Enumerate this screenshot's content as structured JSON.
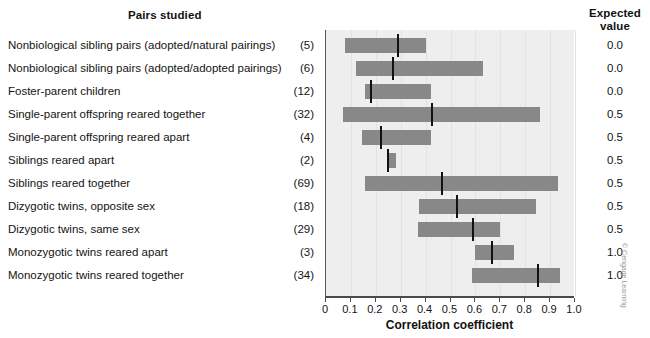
{
  "headers": {
    "pairs_studied": "Pairs studied",
    "expected_value": "Expected\nvalue",
    "expected_value_line1": "Expected",
    "expected_value_line2": "value"
  },
  "credit": "© Cengage Learning",
  "chart_data": {
    "type": "bar",
    "orientation": "horizontal-range",
    "title": "Pairs studied",
    "xlabel": "Correlation coefficient",
    "ylabel": "",
    "xlim": [
      0,
      1.0
    ],
    "xticks": [
      "0",
      "0.1",
      "0.2",
      "0.3",
      "0.4",
      "0.5",
      "0.6",
      "0.7",
      "0.8",
      "0.9",
      "1.0"
    ],
    "xtick_values": [
      0,
      0.1,
      0.2,
      0.3,
      0.4,
      0.5,
      0.6,
      0.7,
      0.8,
      0.9,
      1.0
    ],
    "grid": true,
    "legend": null,
    "categories": [
      "Nonbiological sibling pairs (adopted/natural pairings)",
      "Nonbiological sibling pairs (adopted/adopted pairings)",
      "Foster-parent children",
      "Single-parent offspring reared together",
      "Single-parent offspring reared apart",
      "Siblings reared apart",
      "Siblings reared together",
      "Dizygotic twins, opposite sex",
      "Dizygotic twins, same sex",
      "Monozygotic twins reared apart",
      "Monozygotic twins reared together"
    ],
    "counts": [
      "(5)",
      "(6)",
      "(12)",
      "(32)",
      "(4)",
      "(2)",
      "(69)",
      "(18)",
      "(29)",
      "(3)",
      "(34)"
    ],
    "expected_values": [
      "0.0",
      "0.0",
      "0.0",
      "0.5",
      "0.5",
      "0.5",
      "0.5",
      "0.5",
      "0.5",
      "1.0",
      "1.0"
    ],
    "range_low": [
      0.075,
      0.12,
      0.155,
      0.07,
      0.145,
      0.245,
      0.155,
      0.375,
      0.37,
      0.6,
      0.585
    ],
    "range_high": [
      0.4,
      0.63,
      0.42,
      0.86,
      0.42,
      0.28,
      0.93,
      0.845,
      0.7,
      0.755,
      0.94
    ],
    "median": [
      0.29,
      0.27,
      0.18,
      0.425,
      0.22,
      0.25,
      0.465,
      0.525,
      0.59,
      0.665,
      0.85
    ]
  },
  "colors": {
    "bar": "#888888",
    "marker": "#111111",
    "plot_background": "#eeeeee",
    "axis": "#4a4a4a"
  }
}
